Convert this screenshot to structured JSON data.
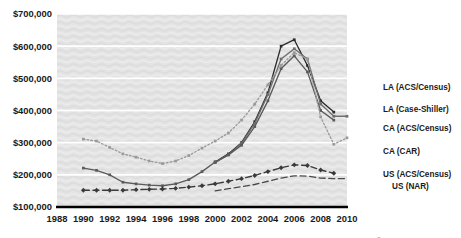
{
  "chart_data": {
    "type": "line",
    "title": "",
    "xlabel": "",
    "ylabel": "",
    "xlim": [
      1988,
      2010
    ],
    "ylim": [
      100000,
      700000
    ],
    "grid": true,
    "legend_position": "right-inline",
    "x_ticks": [
      "1988",
      "1990",
      "1992",
      "1994",
      "1996",
      "1998",
      "2000",
      "2002",
      "2004",
      "2006",
      "2008",
      "2010"
    ],
    "y_ticks": [
      "$100,000",
      "$200,000",
      "$300,000",
      "$400,000",
      "$500,000",
      "$600,000",
      "$700,000"
    ],
    "y_tick_values": [
      100000,
      200000,
      300000,
      400000,
      500000,
      600000,
      700000
    ],
    "series": [
      {
        "name": "LA (ACS/Census)",
        "color": "#2b2b2b",
        "style": "solid",
        "marker": "square",
        "x": [
          2000,
          2001,
          2002,
          2003,
          2004,
          2005,
          2006,
          2007,
          2008,
          2009
        ],
        "values": [
          240000,
          265000,
          300000,
          365000,
          455000,
          600000,
          620000,
          540000,
          430000,
          395000
        ]
      },
      {
        "name": "LA (Case-Shiller)",
        "color": "#6e6e6e",
        "style": "solid",
        "marker": "square",
        "x": [
          2000,
          2001,
          2002,
          2003,
          2004,
          2005,
          2006,
          2007,
          2008,
          2009,
          2010
        ],
        "values": [
          238000,
          262000,
          298000,
          360000,
          450000,
          560000,
          592000,
          560000,
          420000,
          382000,
          382000
        ]
      },
      {
        "name": "CA (ACS/Census)",
        "color": "#5a5a5a",
        "style": "solid",
        "marker": "square",
        "x": [
          1990,
          1991,
          1992,
          1993,
          1994,
          1995,
          1996,
          1997,
          1998,
          1999,
          2000,
          2001,
          2002,
          2003,
          2004,
          2005,
          2006,
          2007,
          2008,
          2009
        ],
        "values": [
          221000,
          214000,
          200000,
          177000,
          172000,
          168000,
          166000,
          172000,
          185000,
          210000,
          240000,
          262000,
          292000,
          350000,
          430000,
          530000,
          570000,
          520000,
          400000,
          370000
        ]
      },
      {
        "name": "CA (CAR)",
        "color": "#9a9a9a",
        "style": "dotted",
        "marker": "square",
        "x": [
          1990,
          1991,
          1992,
          1993,
          1994,
          1995,
          1996,
          1997,
          1998,
          1999,
          2000,
          2001,
          2002,
          2003,
          2004,
          2005,
          2006,
          2007,
          2008,
          2009,
          2010
        ],
        "values": [
          311000,
          305000,
          285000,
          265000,
          255000,
          243000,
          235000,
          243000,
          260000,
          283000,
          305000,
          330000,
          370000,
          420000,
          480000,
          540000,
          580000,
          560000,
          380000,
          295000,
          315000
        ]
      },
      {
        "name": "US (ACS/Census)",
        "color": "#3a3a3a",
        "style": "dashed",
        "marker": "diamond",
        "x": [
          1990,
          1991,
          1992,
          1993,
          1994,
          1995,
          1996,
          1997,
          1998,
          1999,
          2000,
          2001,
          2002,
          2003,
          2004,
          2005,
          2006,
          2007,
          2008,
          2009
        ],
        "values": [
          152000,
          152000,
          152000,
          152000,
          154000,
          155000,
          156000,
          158000,
          162000,
          166000,
          172000,
          180000,
          188000,
          198000,
          210000,
          222000,
          231000,
          229000,
          215000,
          205000
        ]
      },
      {
        "name": "US (NAR)",
        "color": "#4a4a4a",
        "style": "dashed",
        "marker": "none",
        "x": [
          2000,
          2001,
          2002,
          2003,
          2004,
          2005,
          2006,
          2007,
          2008,
          2009,
          2010
        ],
        "values": [
          150000,
          157000,
          163000,
          170000,
          180000,
          190000,
          197000,
          196000,
          190000,
          188000,
          188000
        ]
      }
    ],
    "legend_entries": [
      {
        "label": "LA (ACS/Census)"
      },
      {
        "label": "LA (Case-Shiller)"
      },
      {
        "label": "CA (ACS/Census)"
      },
      {
        "label": "CA (CAR)"
      },
      {
        "label": "US (ACS/Census)"
      },
      {
        "label": "US (NAR)"
      }
    ]
  }
}
